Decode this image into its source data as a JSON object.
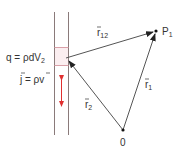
{
  "diagram": {
    "type": "physics-vector-diagram",
    "labels": {
      "charge": "q = ρdV",
      "charge_sub": "2",
      "current": "j = ρv",
      "r12": "r",
      "r12_sub": "12",
      "r1": "r",
      "r1_sub": "1",
      "r2": "r",
      "r2_sub": "2",
      "point": "P",
      "point_sub": "1",
      "origin": "0"
    },
    "colors": {
      "lines": "#555555",
      "arrows": "#222222",
      "tube_walls": "#8a7a7a",
      "volume_element_fill": "#fbeef0",
      "volume_element_border": "#d9a0a8",
      "current_arrow": "#e03030"
    }
  }
}
